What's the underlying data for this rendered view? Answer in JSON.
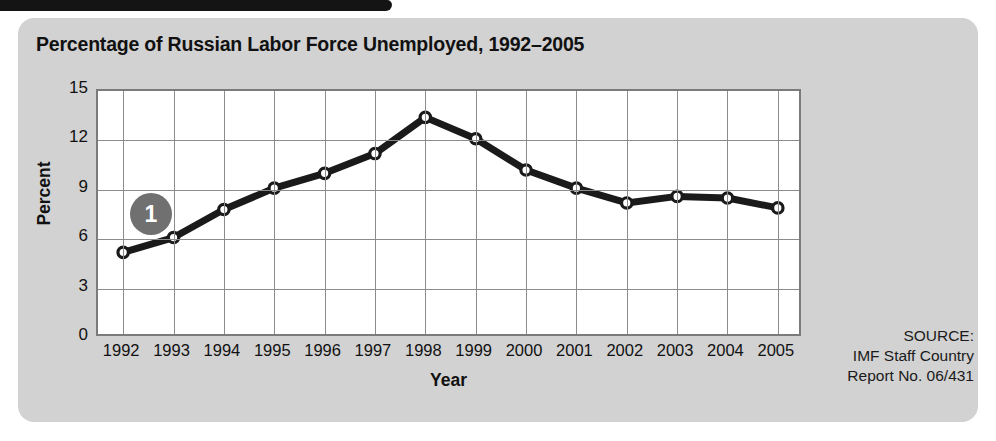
{
  "figure": {
    "title": "Percentage of Russian Labor Force Unemployed, 1992–2005",
    "callout_number": "1",
    "panel_color": "#d2d2d2",
    "accent_color": "#141414"
  },
  "source": {
    "line1": "SOURCE:",
    "line2": "IMF Staff Country",
    "line3": "Report No. 06/431"
  },
  "chart_data": {
    "type": "line",
    "title": "Percentage of Russian Labor Force Unemployed, 1992–2005",
    "xlabel": "Year",
    "ylabel": "Percent",
    "categories": [
      "1992",
      "1993",
      "1994",
      "1995",
      "1996",
      "1997",
      "1998",
      "1999",
      "2000",
      "2001",
      "2002",
      "2003",
      "2004",
      "2005"
    ],
    "values": [
      5.2,
      6.1,
      7.8,
      9.1,
      10.0,
      11.2,
      13.4,
      12.1,
      10.2,
      9.1,
      8.2,
      8.6,
      8.5,
      7.9
    ],
    "ylim": [
      0,
      15
    ],
    "yticks": [
      "0",
      "3",
      "6",
      "9",
      "12",
      "15"
    ],
    "ytick_values": [
      0,
      3,
      6,
      9,
      12,
      15
    ],
    "grid": true,
    "legend": "none",
    "marker": "open-circle",
    "line_color": "#1a1a1a"
  }
}
